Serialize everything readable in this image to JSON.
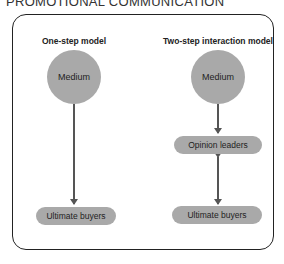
{
  "header": {
    "title": "PROMOTIONAL COMMUNICATION"
  },
  "models": [
    {
      "title": "One-step model",
      "source": "Medium",
      "nodes": [
        "Ultimate buyers"
      ],
      "arrows": [
        "Medium → Ultimate buyers (one-way)"
      ]
    },
    {
      "title": "Two-step interaction model",
      "source": "Medium",
      "nodes": [
        "Opinion leaders",
        "Ultimate buyers"
      ],
      "arrows": [
        "Medium → Opinion leaders (one-way)",
        "Opinion leaders ↔ Ultimate buyers (two-way)"
      ]
    }
  ],
  "colors": {
    "node_fill": "#a9a9a9",
    "line": "#555555",
    "frame": "#222222"
  }
}
